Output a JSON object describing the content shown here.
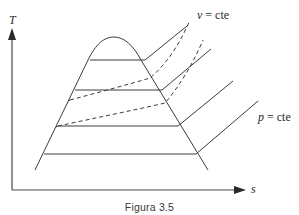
{
  "diagram": {
    "type": "T-s diagram (saturation dome with isobars and isochores)",
    "axes": {
      "y_label": "T",
      "x_label": "s"
    },
    "annotations": {
      "isochore_label_var": "v",
      "isochore_label_rest": " = cte",
      "isobar_label_var": "p",
      "isobar_label_rest": " = cte"
    },
    "caption": "Figura 3.5",
    "colors": {
      "line": "#3c3c3c",
      "background": "#ffffff"
    }
  }
}
